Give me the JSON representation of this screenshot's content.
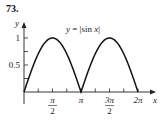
{
  "problem": {
    "number": "73."
  },
  "chart_data": {
    "type": "line",
    "title": "y = |sin x|",
    "xlabel": "x",
    "ylabel": "y",
    "x_ticks": [
      {
        "value": 1.5708,
        "label": "π/2",
        "num": "π",
        "den": "2"
      },
      {
        "value": 3.1416,
        "label": "π"
      },
      {
        "value": 4.7124,
        "label": "3π/2",
        "num": "3π",
        "den": "2"
      },
      {
        "value": 6.2832,
        "label": "2π"
      }
    ],
    "y_ticks": [
      {
        "value": 0.5,
        "label": "0.5"
      },
      {
        "value": 1,
        "label": "1"
      }
    ],
    "xlim": [
      0,
      6.8
    ],
    "ylim": [
      0,
      1.3
    ],
    "grid": false,
    "series": [
      {
        "name": "y = |sin x|",
        "x": [
          0,
          0.3927,
          0.7854,
          1.1781,
          1.5708,
          1.9635,
          2.3562,
          2.7489,
          3.1416,
          3.5343,
          3.927,
          4.3197,
          4.7124,
          5.1051,
          5.4978,
          5.8905,
          6.2832
        ],
        "y": [
          0,
          0.383,
          0.707,
          0.924,
          1,
          0.924,
          0.707,
          0.383,
          0,
          0.383,
          0.707,
          0.924,
          1,
          0.924,
          0.707,
          0.383,
          0
        ]
      }
    ]
  }
}
